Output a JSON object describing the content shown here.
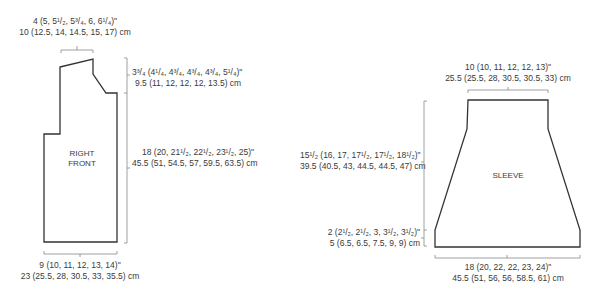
{
  "diagram_type": "knitting-schematic",
  "colors": {
    "outline": "#333333",
    "dimension_line": "#888888",
    "text": "#3a3a3a"
  },
  "right_front": {
    "label_line1": "RIGHT",
    "label_line2": "FRONT",
    "shoulder_width": {
      "in": "4 (5, 5¹/₂, 5³/₄, 6, 6¹/₄)\"",
      "cm": "10 (12.5, 14, 14.5, 15, 17) cm"
    },
    "armhole_depth": {
      "in": "3³/₄ (4¹/₄, 4³/₄, 4³/₄, 4³/₄, 5¹/₄)\"",
      "cm": "9.5 (11, 12, 12, 12, 13.5) cm"
    },
    "length": {
      "in": "18 (20, 21¹/₂, 22¹/₂, 23¹/₂, 25)\"",
      "cm": "45.5 (51, 54.5, 57, 59.5, 63.5) cm"
    },
    "bottom_width": {
      "in": "9 (10, 11, 12, 13, 14)\"",
      "cm": "23 (25.5, 28, 30.5, 33, 35.5) cm"
    }
  },
  "sleeve": {
    "label": "SLEEVE",
    "top_width": {
      "in": "10 (10, 11, 12, 12, 13)\"",
      "cm": "25.5 (25.5, 28, 30.5, 30.5, 33) cm"
    },
    "length": {
      "in": "15¹/₂ (16, 17, 17¹/₂, 17¹/₂, 18¹/₂)\"",
      "cm": "39.5 (40.5, 43, 44.5, 44.5, 47) cm"
    },
    "cuff_depth": {
      "in": "2 (2¹/₂, 2¹/₂, 3, 3¹/₂, 3¹/₂)\"",
      "cm": "5 (6.5, 6.5, 7.5, 9, 9) cm"
    },
    "bottom_width": {
      "in": "18 (20, 22, 22, 23, 24)\"",
      "cm": "45.5 (51, 56, 56, 58.5, 61) cm"
    }
  }
}
